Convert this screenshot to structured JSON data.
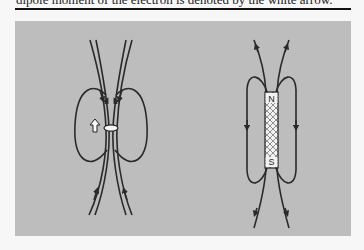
{
  "caption": {
    "text": "dipole moment of the electron is denoted by the white arrow."
  },
  "figure": {
    "panel_color": "#bdbdbd",
    "line_color": "#2a2a2a",
    "left_diagram": {
      "description": "electron magnetic dipole field lines with white arrow",
      "arrow_label": "white-arrow"
    },
    "right_diagram": {
      "description": "bar magnet field lines",
      "north_label": "N",
      "south_label": "S"
    }
  }
}
